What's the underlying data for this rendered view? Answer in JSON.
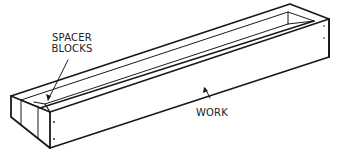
{
  "diagram": {
    "labels": {
      "spacer_blocks_line1": "SPACER",
      "spacer_blocks_line2": "BLOCKS",
      "work": "WORK"
    },
    "colors": {
      "background": "#ffffff",
      "ink": "#1a1a1a"
    }
  }
}
